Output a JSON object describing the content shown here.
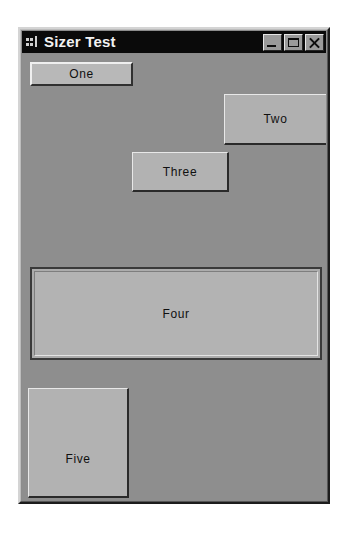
{
  "window": {
    "title": "Sizer Test",
    "icon": "application-icon",
    "caption_buttons": [
      {
        "name": "minimize-button",
        "label": "Minimize",
        "glyph": "minimize-icon"
      },
      {
        "name": "maximize-button",
        "label": "Maximize",
        "glyph": "maximize-icon"
      },
      {
        "name": "close-button",
        "label": "Close",
        "glyph": "close-icon"
      }
    ],
    "colors": {
      "title_bar": "#0a0a0a",
      "title_text": "#f2f2f2",
      "client_background": "#8e8e8e",
      "panel_face": "#b4b4b4",
      "panel_highlight": "#e8e8e8",
      "panel_shadow": "#2a2a2a",
      "page_background": "#ffffff"
    }
  },
  "client": {
    "panels": [
      {
        "id": "one",
        "label": "One"
      },
      {
        "id": "two",
        "label": "Two"
      },
      {
        "id": "three",
        "label": "Three"
      },
      {
        "id": "four",
        "label": "Four"
      },
      {
        "id": "five",
        "label": "Five"
      }
    ]
  }
}
